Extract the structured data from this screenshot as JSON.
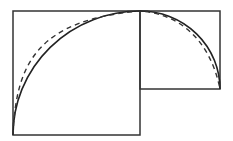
{
  "diagram": {
    "colors": {
      "stroke": "#333333",
      "background": "#ffffff"
    },
    "shapes": {
      "large_square": {
        "x": 13,
        "y": 11,
        "w": 127,
        "h": 124
      },
      "small_square": {
        "x": 140,
        "y": 11,
        "w": 80,
        "h": 78
      }
    },
    "curves": {
      "solid": "M13,135 A127,124 0 0 1 140,11 A80,78 0 0 1 220,89",
      "dashed": "M13,135 C16,60 40,20 140,11 C180,14 210,40 220,89"
    }
  }
}
